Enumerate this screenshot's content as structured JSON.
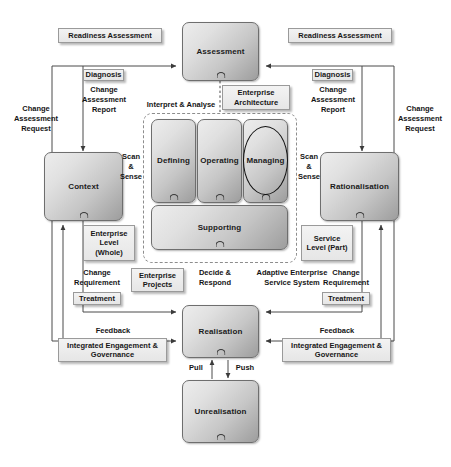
{
  "diagram": {
    "title": "Adaptive Enterprise Service System",
    "colors": {
      "box_fill_light": "#ededed",
      "box_fill_dark": "#9d9d9d",
      "box_border": "#6e6e6e",
      "label_fill": "#ebebeb",
      "label_border": "#9a9a9a",
      "line": "#4a4a4a",
      "ellipse_stroke": "#111111",
      "dashed_frame": "#8d8d8d"
    },
    "process_nodes": [
      {
        "id": "assessment",
        "label": "Assessment"
      },
      {
        "id": "context",
        "label": "Context"
      },
      {
        "id": "rationalisation",
        "label": "Rationalisation"
      },
      {
        "id": "defining",
        "label": "Defining"
      },
      {
        "id": "operating",
        "label": "Operating"
      },
      {
        "id": "managing",
        "label": "Managing"
      },
      {
        "id": "supporting",
        "label": "Supporting"
      },
      {
        "id": "realisation",
        "label": "Realisation"
      },
      {
        "id": "unrealisation",
        "label": "Unrealisation"
      }
    ],
    "shaded_labels": [
      {
        "id": "readiness-left",
        "text": "Readiness Assessment"
      },
      {
        "id": "readiness-right",
        "text": "Readiness Assessment"
      },
      {
        "id": "diagnosis-left",
        "text": "Diagnosis"
      },
      {
        "id": "diagnosis-right",
        "text": "Diagnosis"
      },
      {
        "id": "enterprise-architecture",
        "text": "Enterprise\nArchitecture"
      },
      {
        "id": "enterprise-level",
        "text": "Enterprise\nLevel\n(Whole)"
      },
      {
        "id": "service-level",
        "text": "Service\nLevel\n(Part)"
      },
      {
        "id": "enterprise-projects",
        "text": "Enterprise\nProjects"
      },
      {
        "id": "treatment-left",
        "text": "Treatment"
      },
      {
        "id": "treatment-right",
        "text": "Treatment"
      },
      {
        "id": "governance-left",
        "text": "Integrated\nEngagement & Governance"
      },
      {
        "id": "governance-right",
        "text": "Integrated\nEngagement & Governance"
      }
    ],
    "annotations": [
      {
        "id": "change-assessment-request-left",
        "text": "Change\nAssessment\nRequest"
      },
      {
        "id": "change-assessment-request-right",
        "text": "Change\nAssessment\nRequest"
      },
      {
        "id": "change-assessment-report-left",
        "text": "Change\nAssessment\nReport"
      },
      {
        "id": "change-assessment-report-right",
        "text": "Change\nAssessment\nReport"
      },
      {
        "id": "interpret-analyse",
        "text": "Interpret & Analyse"
      },
      {
        "id": "scan-sense-left",
        "text": "Scan\n&\nSense"
      },
      {
        "id": "scan-sense-right",
        "text": "Scan\n&\nSense"
      },
      {
        "id": "change-requirement-left",
        "text": "Change\nRequirement"
      },
      {
        "id": "change-requirement-right",
        "text": "Change\nRequirement"
      },
      {
        "id": "decide-respond",
        "text": "Decide  &\nRespond"
      },
      {
        "id": "adaptive-enterprise-service-system",
        "text": "Adaptive Enterprise\nService System"
      },
      {
        "id": "feedback-left",
        "text": "Feedback"
      },
      {
        "id": "feedback-right",
        "text": "Feedback"
      },
      {
        "id": "pull",
        "text": "Pull"
      },
      {
        "id": "push",
        "text": "Push"
      }
    ]
  }
}
